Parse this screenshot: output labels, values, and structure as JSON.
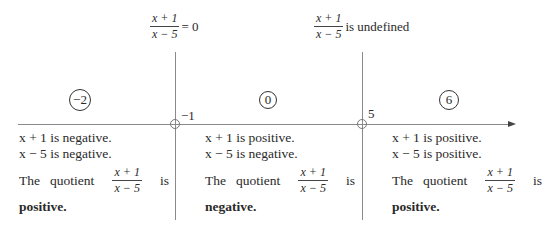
{
  "top_labels": {
    "zero": {
      "numerator": "x + 1",
      "denominator": "x − 5",
      "suffix": "= 0"
    },
    "undefined": {
      "numerator": "x + 1",
      "denominator": "x − 5",
      "suffix": "is undefined"
    }
  },
  "test_points": [
    "−2",
    "0",
    "6"
  ],
  "critical_points": [
    "−1",
    "5"
  ],
  "regions": [
    {
      "line1": "x + 1 is negative.",
      "line2": "x − 5 is negative.",
      "quotient_prefix": "The   quotient",
      "quotient_num": "x + 1",
      "quotient_den": "x − 5",
      "quotient_suffix": "is",
      "result": "positive",
      "period": "."
    },
    {
      "line1": "x + 1 is positive.",
      "line2": "x − 5 is negative.",
      "quotient_prefix": "The   quotient",
      "quotient_num": "x + 1",
      "quotient_den": "x − 5",
      "quotient_suffix": "is",
      "result": "negative",
      "period": "."
    },
    {
      "line1": "x + 1 is positive.",
      "line2": "x − 5 is positive.",
      "quotient_prefix": "The   quotient",
      "quotient_num": "x + 1",
      "quotient_den": "x − 5",
      "quotient_suffix": "is",
      "result": "positive",
      "period": "."
    }
  ]
}
